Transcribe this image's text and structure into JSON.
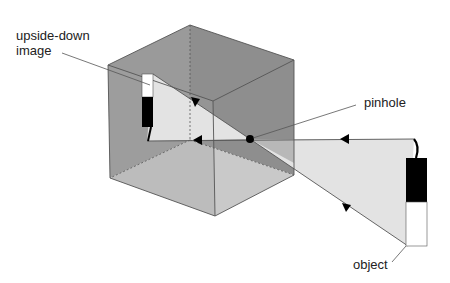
{
  "diagram": {
    "labels": {
      "image_line1": "upside-down",
      "image_line2": "image",
      "pinhole": "pinhole",
      "object": "object"
    },
    "colors": {
      "back_wall": "#8c8c8c",
      "left_wall": "#9a9a9a",
      "floor": "#c8c8c8",
      "light_cone": "#e2e2e2",
      "edge": "#555555",
      "black": "#000000",
      "white": "#ffffff"
    }
  }
}
